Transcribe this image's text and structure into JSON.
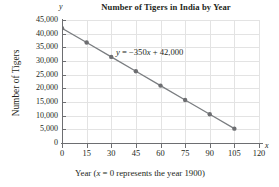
{
  "chart_data": {
    "type": "line",
    "title": "Number of Tigers in India by Year",
    "xlabel": "Year (x = 0 represents the year 1900)",
    "ylabel": "Number of Tigers",
    "x_axis_letter": "y",
    "y_axis_letter": "x",
    "equation": "y = −350x + 42,000",
    "equation_parts": {
      "lhs": "y",
      "rhs": " = −350",
      "var": "x",
      "tail": " + 42,000"
    },
    "x": [
      0,
      15,
      30,
      45,
      60,
      75,
      90,
      105
    ],
    "values": [
      42000,
      36750,
      31500,
      26250,
      21000,
      15750,
      10500,
      5250
    ],
    "xlim": [
      0,
      120
    ],
    "ylim": [
      0,
      45000
    ],
    "xticks": [
      0,
      15,
      30,
      45,
      60,
      75,
      90,
      105,
      120
    ],
    "xtick_labels": [
      "0",
      "15",
      "30",
      "45",
      "60",
      "75",
      "90",
      "105",
      "120"
    ],
    "yticks": [
      0,
      5000,
      10000,
      15000,
      20000,
      25000,
      30000,
      35000,
      40000,
      45000
    ],
    "ytick_labels": [
      "0",
      "5,000",
      "10,000",
      "15,000",
      "20,000",
      "25,000",
      "30,000",
      "35,000",
      "40,000",
      "45,000"
    ],
    "grid": true,
    "legend": false,
    "series_color": "#7a7d80",
    "marker_color": "#6d6e71",
    "grid_color": "#e3e3e3",
    "axis_color": "#6d6e71",
    "slope": -350,
    "intercept": 42000
  },
  "axis_titles": {
    "y": "Number of Tigers",
    "x_prefix": "Year (",
    "x_var": "x",
    "x_suffix": " = 0 represents the year 1900)"
  }
}
